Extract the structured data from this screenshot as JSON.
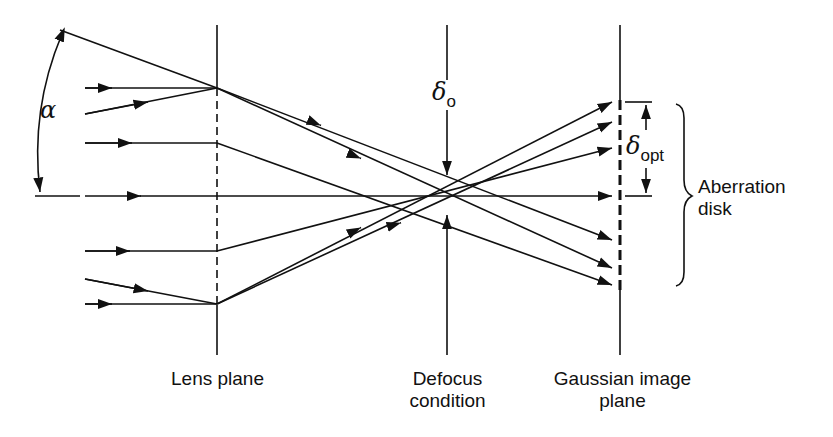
{
  "diagram": {
    "labels": {
      "alpha": "α",
      "delta_o": "δ",
      "delta_o_sub": "o",
      "delta_opt": "δ",
      "delta_opt_sub": "opt",
      "aberration_disk_line1": "Aberration",
      "aberration_disk_line2": "disk",
      "lens_plane": "Lens plane",
      "defocus_line1": "Defocus",
      "defocus_line2": "condition",
      "gaussian_line1": "Gaussian image",
      "gaussian_line2": "plane"
    },
    "colors": {
      "ink": "#111111",
      "background": "#ffffff"
    }
  }
}
